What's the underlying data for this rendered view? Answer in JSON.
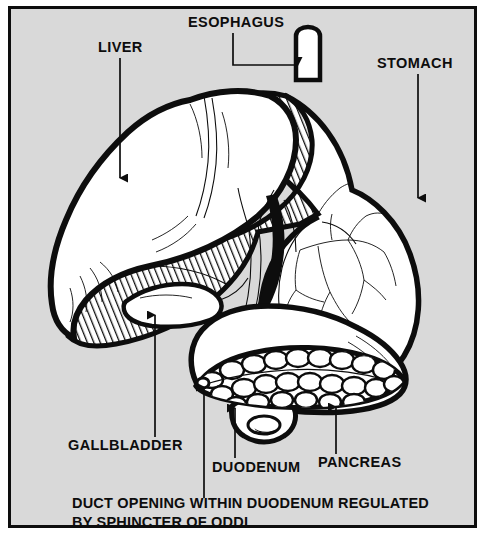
{
  "figure": {
    "kind": "anatomical-illustration",
    "background_color": "#d9d9d9",
    "ink_color": "#0d0d0d",
    "organ_fill_color": "#ffffff",
    "page_color": "#ffffff"
  },
  "labels": [
    {
      "id": "liver",
      "text": "LIVER",
      "text_x": 98,
      "text_y": 52,
      "leader": "M 120 58 L 120 182",
      "arrow_at": "bottom",
      "arrow_x": 120,
      "arrow_y": 184
    },
    {
      "id": "esophagus",
      "text": "ESOPHAGUS",
      "text_x": 188,
      "text_y": 27,
      "leader": "M 233 33 L 233 65 L 300 65",
      "arrow_at": "right",
      "arrow_x": 303,
      "arrow_y": 65
    },
    {
      "id": "stomach",
      "text": "STOMACH",
      "text_x": 377,
      "text_y": 68,
      "leader": "M 418 74 L 418 202",
      "arrow_at": "bottom",
      "arrow_x": 418,
      "arrow_y": 204
    },
    {
      "id": "gallbladder",
      "text": "GALLBLADDER",
      "text_x": 68,
      "text_y": 450,
      "leader": "M 155 437 L 155 311",
      "arrow_at": "top",
      "arrow_x": 155,
      "arrow_y": 309
    },
    {
      "id": "duodenum",
      "text": "DUODENUM",
      "text_x": 212,
      "text_y": 472,
      "leader": "M 235 458 L 235 404",
      "arrow_at": "top",
      "arrow_x": 235,
      "arrow_y": 402
    },
    {
      "id": "pancreas",
      "text": "PANCREAS",
      "text_x": 318,
      "text_y": 467,
      "leader": "M 336 454 L 336 403",
      "arrow_at": "top",
      "arrow_x": 336,
      "arrow_y": 401
    },
    {
      "id": "duct-opening",
      "text": "",
      "text_x": 0,
      "text_y": 0,
      "leader": "M 204 498 L 204 383",
      "arrow_at": "top",
      "arrow_x": 204,
      "arrow_y": 381
    }
  ],
  "caption": {
    "line1": "DUCT OPENING WITHIN DUODENUM REGULATED",
    "line2": "BY SPHINCTER OF ODDI",
    "line1_x": 72,
    "line1_y": 508,
    "line2_x": 72,
    "line2_y": 527
  },
  "organs": [
    {
      "id": "liver",
      "name": "Liver",
      "texture": "smooth-with-diagonal-hatch-lobe"
    },
    {
      "id": "stomach",
      "name": "Stomach",
      "texture": "smooth-with-branching-vessels"
    },
    {
      "id": "esophagus",
      "name": "Esophagus",
      "texture": "smooth-tube"
    },
    {
      "id": "gallbladder",
      "name": "Gallbladder",
      "texture": "smooth-pear"
    },
    {
      "id": "pancreas",
      "name": "Pancreas",
      "texture": "lobulated-cobblestone"
    },
    {
      "id": "duodenum",
      "name": "Duodenum",
      "texture": "smooth-tube-coil"
    }
  ]
}
